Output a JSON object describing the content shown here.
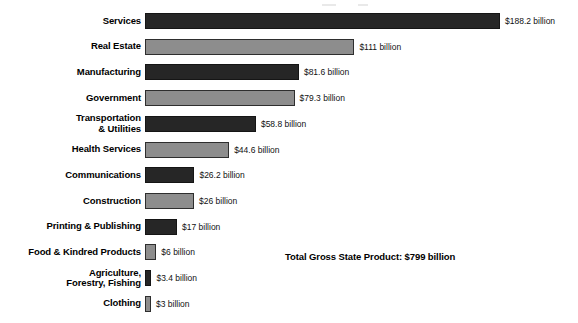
{
  "chart_data": {
    "type": "bar",
    "orientation": "horizontal",
    "title": "",
    "xlabel": "",
    "ylabel": "",
    "unit": "billion USD",
    "grid": false,
    "legend": "none",
    "axis_visible": false,
    "xlim": [
      0,
      188.2
    ],
    "categories": [
      "Services",
      "Real Estate",
      "Manufacturing",
      "Government",
      "Transportation\n& Utilities",
      "Health Services",
      "Communications",
      "Construction",
      "Printing & Publishing",
      "Food & Kindred Products",
      "Agriculture,\nForestry, Fishing",
      "Clothing"
    ],
    "values": [
      188.2,
      111,
      81.6,
      79.3,
      58.8,
      44.6,
      26.2,
      26,
      17,
      6,
      3.4,
      3
    ],
    "value_labels": [
      "$188.2 billion",
      "$111 billion",
      "$81.6 billion",
      "$79.3 billion",
      "$58.8 billion",
      "$44.6 billion",
      "$26.2 billion",
      "$26 billion",
      "$17 billion",
      "$6 billion",
      "$3.4 billion",
      "$3 billion"
    ],
    "bar_colors": [
      "dark",
      "light",
      "dark",
      "light",
      "dark",
      "light",
      "dark",
      "light",
      "dark",
      "light",
      "dark",
      "light"
    ],
    "annotations": [
      {
        "name": "total-gross-state-product",
        "text": "Total Gross State Product: $799 billion"
      }
    ]
  },
  "colors": {
    "dark_bar": "#262626",
    "light_bar": "#8d8d8d",
    "bar_outline": "#2e2e2e",
    "background": "#ffffff",
    "text": "#000000"
  },
  "annotation": {
    "total": "Total Gross State Product: $799 billion"
  }
}
